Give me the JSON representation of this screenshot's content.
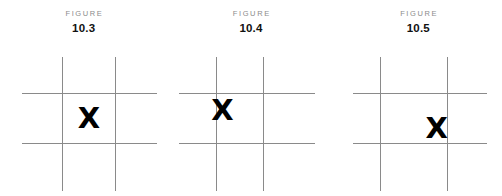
{
  "page": {
    "background": "#ffffff",
    "grid_line_color": "#8a8a8a",
    "mark_color": "#000000",
    "caption_word_color": "#8c8c8c",
    "caption_number_color": "#111111"
  },
  "figures": [
    {
      "caption_word": "FIGURE",
      "caption_number": "10.3",
      "mark": "X",
      "mark_position": "center-cell"
    },
    {
      "caption_word": "FIGURE",
      "caption_number": "10.4",
      "mark": "X",
      "mark_position": "upper-left-intersection"
    },
    {
      "caption_word": "FIGURE",
      "caption_number": "10.5",
      "mark": "X",
      "mark_position": "lower-right-intersection"
    }
  ]
}
